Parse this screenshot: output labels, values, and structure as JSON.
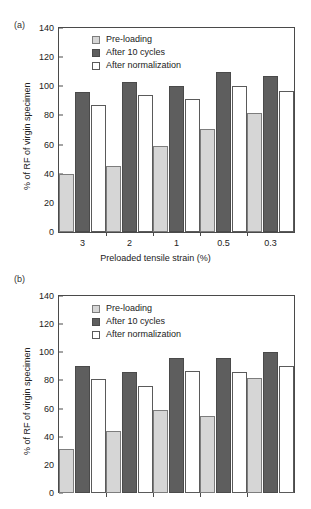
{
  "figure": {
    "panels": [
      {
        "tag": "(a)"
      },
      {
        "tag": "(b)"
      }
    ]
  },
  "legend": {
    "entries": [
      {
        "label": "Pre-loading",
        "color": "#d6d6d6"
      },
      {
        "label": "After 10 cycles",
        "color": "#5e5e5e"
      },
      {
        "label": "After normalization",
        "color": "#ffffff"
      }
    ]
  },
  "axis": {
    "y_ticks": [
      "0",
      "20",
      "40",
      "60",
      "80",
      "100",
      "120",
      "140"
    ],
    "y_label": "% of RF of virgin specimen",
    "x_ticks": [
      "3",
      "2",
      "1",
      "0.5",
      "0.3"
    ],
    "x_label": "Preloaded tensile strain (%)"
  },
  "chart_data": [
    {
      "type": "bar",
      "panel": "(a)",
      "title": "",
      "xlabel": "Preloaded tensile strain (%)",
      "ylabel": "% of RF of virgin specimen",
      "ylim": [
        0,
        140
      ],
      "ytick_step": 20,
      "grid": false,
      "legend_position": "top-left",
      "categories": [
        "3",
        "2",
        "1",
        "0.5",
        "0.3"
      ],
      "series": [
        {
          "name": "Pre-loading",
          "color": "#d6d6d6",
          "values": [
            40,
            45,
            59,
            71,
            82
          ]
        },
        {
          "name": "After 10 cycles",
          "color": "#5e5e5e",
          "values": [
            96,
            103,
            100,
            110,
            107
          ]
        },
        {
          "name": "After normalization",
          "color": "#ffffff",
          "values": [
            87,
            94,
            91,
            100,
            97
          ]
        }
      ]
    },
    {
      "type": "bar",
      "panel": "(b)",
      "title": "",
      "xlabel": "",
      "ylabel": "% of RF of virgin specimen",
      "ylim": [
        0,
        140
      ],
      "ytick_step": 20,
      "grid": false,
      "legend_position": "top-left",
      "categories": [
        "3",
        "2",
        "1",
        "0.5",
        "0.3"
      ],
      "series": [
        {
          "name": "Pre-loading",
          "color": "#d6d6d6",
          "values": [
            31,
            44,
            59,
            55,
            82
          ]
        },
        {
          "name": "After 10 cycles",
          "color": "#5e5e5e",
          "values": [
            90,
            86,
            96,
            96,
            100
          ]
        },
        {
          "name": "After normalization",
          "color": "#ffffff",
          "values": [
            81,
            76,
            87,
            86,
            90
          ]
        }
      ]
    }
  ]
}
